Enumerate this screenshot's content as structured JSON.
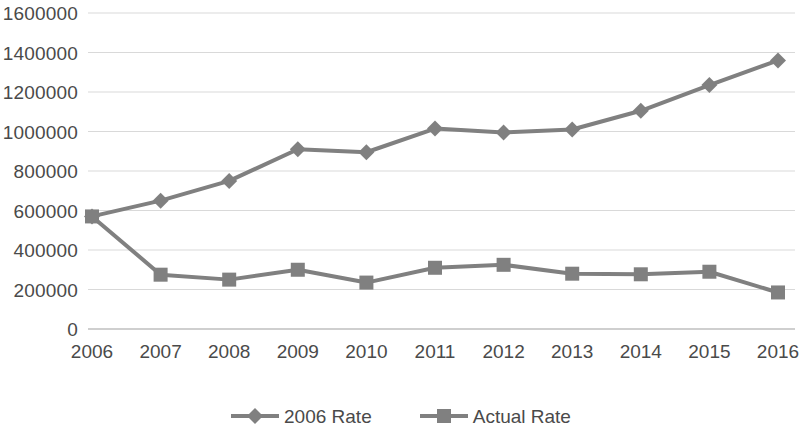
{
  "chart_data": {
    "type": "line",
    "title": "",
    "subtitle": "",
    "xlabel": "",
    "ylabel": "",
    "categories": [
      "2006",
      "2007",
      "2008",
      "2009",
      "2010",
      "2011",
      "2012",
      "2013",
      "2014",
      "2015",
      "2016"
    ],
    "series": [
      {
        "name": "2006 Rate",
        "marker": "diamond",
        "color": "#808080",
        "values": [
          570000,
          650000,
          750000,
          910000,
          895000,
          1015000,
          995000,
          1010000,
          1105000,
          1235000,
          1360000
        ]
      },
      {
        "name": "Actual Rate",
        "marker": "square",
        "color": "#808080",
        "values": [
          570000,
          275000,
          250000,
          300000,
          235000,
          310000,
          325000,
          280000,
          277000,
          290000,
          185000
        ]
      }
    ],
    "ylim": [
      0,
      1600000
    ],
    "ytick_step": 200000,
    "ytick_labels": [
      "0",
      "200000",
      "400000",
      "600000",
      "800000",
      "1000000",
      "1200000",
      "1400000",
      "1600000"
    ],
    "grid": {
      "horizontal": true,
      "vertical": false,
      "color": "#d9d9d9"
    },
    "legend": {
      "position": "bottom",
      "entries": [
        "2006 Rate",
        "Actual Rate"
      ]
    },
    "axis_line_color": "#bfbfbf",
    "text_color": "#4a4a4a"
  }
}
